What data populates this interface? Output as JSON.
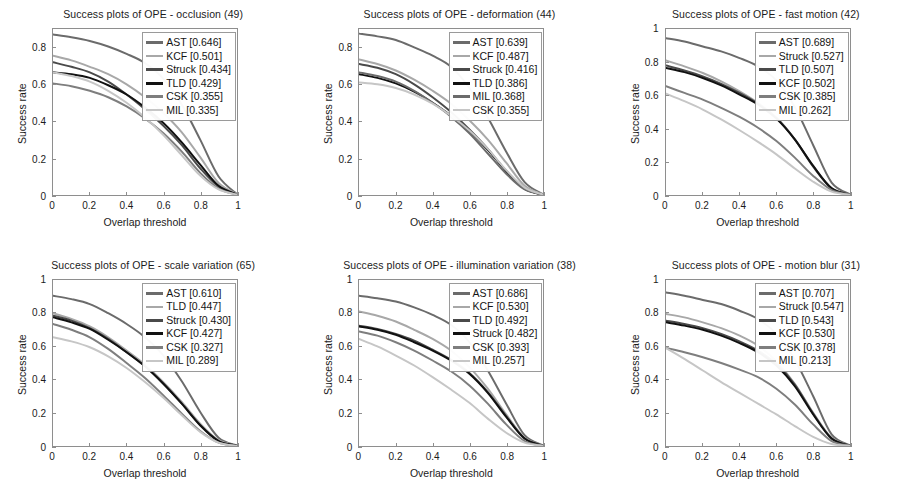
{
  "figure": {
    "axis": {
      "xlabel": "Overlap threshold",
      "ylabel": "Success rate",
      "xticks": [
        "0",
        "0.2",
        "0.4",
        "0.6",
        "0.8",
        "1"
      ],
      "yticks_full": [
        "0",
        "0.2",
        "0.4",
        "0.6",
        "0.8",
        "1"
      ],
      "yticks_clipped": [
        "0",
        "0.2",
        "0.4",
        "0.6",
        "0.8"
      ],
      "grid": false,
      "legend_position": "upper right"
    },
    "colors": {
      "AST": "#6b6b6b",
      "KCF": "#a8a8a8",
      "Struck": "#4a4a4a",
      "TLD": "#111111",
      "CSK": "#7e7e7e",
      "MIL": "#c6c6c6"
    }
  },
  "chart_data": [
    {
      "type": "line",
      "title": "Success plots of OPE - occlusion (49)",
      "xlabel": "Overlap threshold",
      "ylabel": "Success rate",
      "xlim": [
        0,
        1
      ],
      "ylim": [
        0,
        0.9
      ],
      "x": [
        0,
        0.1,
        0.2,
        0.3,
        0.4,
        0.5,
        0.6,
        0.7,
        0.8,
        0.9,
        1
      ],
      "series": [
        {
          "name": "AST",
          "score": "0.646",
          "label": "AST [0.646]",
          "color": "#6b6b6b",
          "values": [
            0.87,
            0.855,
            0.835,
            0.805,
            0.765,
            0.715,
            0.63,
            0.49,
            0.3,
            0.1,
            0.005
          ]
        },
        {
          "name": "KCF",
          "score": "0.501",
          "label": "KCF [0.501]",
          "color": "#a8a8a8",
          "values": [
            0.755,
            0.73,
            0.695,
            0.655,
            0.6,
            0.53,
            0.445,
            0.34,
            0.205,
            0.065,
            0.004
          ]
        },
        {
          "name": "Struck",
          "score": "0.434",
          "label": "Struck [0.434]",
          "color": "#4a4a4a",
          "values": [
            0.72,
            0.695,
            0.665,
            0.615,
            0.545,
            0.465,
            0.375,
            0.27,
            0.145,
            0.045,
            0.003
          ]
        },
        {
          "name": "TLD",
          "score": "0.429",
          "label": "TLD [0.429]",
          "color": "#111111",
          "values": [
            0.665,
            0.655,
            0.635,
            0.595,
            0.545,
            0.475,
            0.39,
            0.285,
            0.165,
            0.05,
            0.003
          ]
        },
        {
          "name": "CSK",
          "score": "0.355",
          "label": "CSK [0.355]",
          "color": "#7e7e7e",
          "values": [
            0.605,
            0.59,
            0.565,
            0.53,
            0.48,
            0.415,
            0.335,
            0.235,
            0.12,
            0.035,
            0.002
          ]
        },
        {
          "name": "MIL",
          "score": "0.335",
          "label": "MIL [0.335]",
          "color": "#c6c6c6",
          "values": [
            0.665,
            0.645,
            0.615,
            0.565,
            0.5,
            0.42,
            0.325,
            0.215,
            0.105,
            0.03,
            0.002
          ]
        }
      ]
    },
    {
      "type": "line",
      "title": "Success plots of OPE - deformation (44)",
      "xlabel": "Overlap threshold",
      "ylabel": "Success rate",
      "xlim": [
        0,
        1
      ],
      "ylim": [
        0,
        0.9
      ],
      "x": [
        0,
        0.1,
        0.2,
        0.3,
        0.4,
        0.5,
        0.6,
        0.7,
        0.8,
        0.9,
        1
      ],
      "series": [
        {
          "name": "AST",
          "score": "0.639",
          "label": "AST [0.639]",
          "color": "#6b6b6b",
          "values": [
            0.875,
            0.86,
            0.84,
            0.8,
            0.755,
            0.695,
            0.58,
            0.42,
            0.235,
            0.07,
            0.004
          ]
        },
        {
          "name": "KCF",
          "score": "0.487",
          "label": "KCF [0.487]",
          "color": "#a8a8a8",
          "values": [
            0.735,
            0.71,
            0.675,
            0.625,
            0.565,
            0.495,
            0.405,
            0.3,
            0.175,
            0.05,
            0.003
          ]
        },
        {
          "name": "Struck",
          "score": "0.416",
          "label": "Struck [0.416]",
          "color": "#4a4a4a",
          "values": [
            0.71,
            0.69,
            0.655,
            0.6,
            0.53,
            0.45,
            0.355,
            0.25,
            0.13,
            0.035,
            0.002
          ]
        },
        {
          "name": "TLD",
          "score": "0.386",
          "label": "TLD [0.386]",
          "color": "#111111",
          "values": [
            0.655,
            0.635,
            0.605,
            0.56,
            0.5,
            0.43,
            0.345,
            0.245,
            0.13,
            0.035,
            0.002
          ]
        },
        {
          "name": "MIL",
          "score": "0.368",
          "label": "MIL [0.368]",
          "color": "#6b6b6b",
          "values": [
            0.665,
            0.645,
            0.615,
            0.565,
            0.5,
            0.425,
            0.335,
            0.225,
            0.115,
            0.03,
            0.002
          ]
        },
        {
          "name": "CSK",
          "score": "0.355",
          "label": "CSK [0.355]",
          "color": "#c6c6c6",
          "values": [
            0.61,
            0.6,
            0.58,
            0.545,
            0.495,
            0.43,
            0.35,
            0.25,
            0.135,
            0.04,
            0.002
          ]
        }
      ]
    },
    {
      "type": "line",
      "title": "Success plots of OPE - fast motion (42)",
      "xlabel": "Overlap threshold",
      "ylabel": "Success rate",
      "xlim": [
        0,
        1
      ],
      "ylim": [
        0,
        1
      ],
      "x": [
        0,
        0.1,
        0.2,
        0.3,
        0.4,
        0.5,
        0.6,
        0.7,
        0.8,
        0.9,
        1
      ],
      "series": [
        {
          "name": "AST",
          "score": "0.689",
          "label": "AST [0.689]",
          "color": "#6b6b6b",
          "values": [
            0.945,
            0.925,
            0.895,
            0.865,
            0.825,
            0.775,
            0.69,
            0.53,
            0.3,
            0.075,
            0.004
          ]
        },
        {
          "name": "Struck",
          "score": "0.527",
          "label": "Struck [0.527]",
          "color": "#a8a8a8",
          "values": [
            0.81,
            0.775,
            0.735,
            0.685,
            0.625,
            0.555,
            0.465,
            0.335,
            0.175,
            0.04,
            0.002
          ]
        },
        {
          "name": "TLD",
          "score": "0.507",
          "label": "TLD [0.507]",
          "color": "#4a4a4a",
          "values": [
            0.78,
            0.75,
            0.715,
            0.67,
            0.615,
            0.55,
            0.465,
            0.335,
            0.17,
            0.04,
            0.002
          ]
        },
        {
          "name": "KCF",
          "score": "0.502",
          "label": "KCF [0.502]",
          "color": "#111111",
          "values": [
            0.765,
            0.74,
            0.705,
            0.66,
            0.605,
            0.545,
            0.46,
            0.335,
            0.175,
            0.04,
            0.002
          ]
        },
        {
          "name": "CSK",
          "score": "0.385",
          "label": "CSK [0.385]",
          "color": "#7e7e7e",
          "values": [
            0.655,
            0.615,
            0.575,
            0.525,
            0.47,
            0.405,
            0.325,
            0.225,
            0.115,
            0.03,
            0.002
          ]
        },
        {
          "name": "MIL",
          "score": "0.262",
          "label": "MIL [0.262]",
          "color": "#c6c6c6",
          "values": [
            0.61,
            0.565,
            0.515,
            0.455,
            0.39,
            0.32,
            0.245,
            0.16,
            0.08,
            0.02,
            0.001
          ]
        }
      ]
    },
    {
      "type": "line",
      "title": "Success plots of OPE - scale variation (65)",
      "xlabel": "Overlap threshold",
      "ylabel": "Success rate",
      "xlim": [
        0,
        1
      ],
      "ylim": [
        0,
        1
      ],
      "x": [
        0,
        0.1,
        0.2,
        0.3,
        0.4,
        0.5,
        0.6,
        0.7,
        0.8,
        0.9,
        1
      ],
      "series": [
        {
          "name": "AST",
          "score": "0.610",
          "label": "AST [0.610]",
          "color": "#6b6b6b",
          "values": [
            0.905,
            0.885,
            0.855,
            0.8,
            0.735,
            0.655,
            0.545,
            0.39,
            0.205,
            0.05,
            0.003
          ]
        },
        {
          "name": "TLD",
          "score": "0.447",
          "label": "TLD [0.447]",
          "color": "#a8a8a8",
          "values": [
            0.8,
            0.765,
            0.72,
            0.655,
            0.575,
            0.49,
            0.385,
            0.265,
            0.135,
            0.035,
            0.002
          ]
        },
        {
          "name": "Struck",
          "score": "0.430",
          "label": "Struck [0.430]",
          "color": "#4a4a4a",
          "values": [
            0.785,
            0.755,
            0.71,
            0.645,
            0.565,
            0.48,
            0.375,
            0.255,
            0.125,
            0.03,
            0.002
          ]
        },
        {
          "name": "KCF",
          "score": "0.427",
          "label": "KCF [0.427]",
          "color": "#111111",
          "values": [
            0.775,
            0.745,
            0.705,
            0.64,
            0.565,
            0.48,
            0.375,
            0.255,
            0.125,
            0.03,
            0.002
          ]
        },
        {
          "name": "CSK",
          "score": "0.327",
          "label": "CSK [0.327]",
          "color": "#7e7e7e",
          "values": [
            0.735,
            0.7,
            0.655,
            0.585,
            0.5,
            0.41,
            0.305,
            0.195,
            0.09,
            0.02,
            0.001
          ]
        },
        {
          "name": "MIL",
          "score": "0.289",
          "label": "MIL [0.289]",
          "color": "#c6c6c6",
          "values": [
            0.655,
            0.63,
            0.595,
            0.54,
            0.47,
            0.385,
            0.29,
            0.185,
            0.085,
            0.02,
            0.001
          ]
        }
      ]
    },
    {
      "type": "line",
      "title": "Success plots of OPE - illumination variation (38)",
      "xlabel": "Overlap threshold",
      "ylabel": "Success rate",
      "xlim": [
        0,
        1
      ],
      "ylim": [
        0,
        1
      ],
      "x": [
        0,
        0.1,
        0.2,
        0.3,
        0.4,
        0.5,
        0.6,
        0.7,
        0.8,
        0.9,
        1
      ],
      "series": [
        {
          "name": "AST",
          "score": "0.686",
          "label": "AST [0.686]",
          "color": "#6b6b6b",
          "values": [
            0.905,
            0.89,
            0.87,
            0.835,
            0.79,
            0.73,
            0.625,
            0.455,
            0.255,
            0.065,
            0.004
          ]
        },
        {
          "name": "KCF",
          "score": "0.530",
          "label": "KCF [0.530]",
          "color": "#a8a8a8",
          "values": [
            0.81,
            0.785,
            0.75,
            0.7,
            0.645,
            0.575,
            0.475,
            0.345,
            0.19,
            0.05,
            0.003
          ]
        },
        {
          "name": "TLD",
          "score": "0.492",
          "label": "TLD [0.492]",
          "color": "#4a4a4a",
          "values": [
            0.725,
            0.705,
            0.675,
            0.635,
            0.58,
            0.52,
            0.44,
            0.325,
            0.18,
            0.045,
            0.002
          ]
        },
        {
          "name": "Struck",
          "score": "0.482",
          "label": "Struck [0.482]",
          "color": "#111111",
          "values": [
            0.72,
            0.7,
            0.67,
            0.625,
            0.575,
            0.515,
            0.435,
            0.32,
            0.175,
            0.045,
            0.002
          ]
        },
        {
          "name": "CSK",
          "score": "0.393",
          "label": "CSK [0.393]",
          "color": "#7e7e7e",
          "values": [
            0.69,
            0.665,
            0.625,
            0.575,
            0.515,
            0.45,
            0.365,
            0.255,
            0.13,
            0.03,
            0.002
          ]
        },
        {
          "name": "MIL",
          "score": "0.257",
          "label": "MIL [0.257]",
          "color": "#c6c6c6",
          "values": [
            0.645,
            0.6,
            0.545,
            0.485,
            0.415,
            0.34,
            0.26,
            0.165,
            0.08,
            0.02,
            0.001
          ]
        }
      ]
    },
    {
      "type": "line",
      "title": "Success plots of OPE - motion blur (31)",
      "xlabel": "Overlap threshold",
      "ylabel": "Success rate",
      "xlim": [
        0,
        1
      ],
      "ylim": [
        0,
        1
      ],
      "x": [
        0,
        0.1,
        0.2,
        0.3,
        0.4,
        0.5,
        0.6,
        0.7,
        0.8,
        0.9,
        1
      ],
      "series": [
        {
          "name": "AST",
          "score": "0.707",
          "label": "AST [0.707]",
          "color": "#6b6b6b",
          "values": [
            0.925,
            0.905,
            0.88,
            0.855,
            0.815,
            0.765,
            0.675,
            0.52,
            0.3,
            0.07,
            0.004
          ]
        },
        {
          "name": "Struck",
          "score": "0.547",
          "label": "Struck [0.547]",
          "color": "#a8a8a8",
          "values": [
            0.795,
            0.775,
            0.745,
            0.71,
            0.665,
            0.605,
            0.51,
            0.375,
            0.2,
            0.05,
            0.002
          ]
        },
        {
          "name": "TLD",
          "score": "0.543",
          "label": "TLD [0.543]",
          "color": "#4a4a4a",
          "values": [
            0.755,
            0.735,
            0.71,
            0.675,
            0.63,
            0.575,
            0.495,
            0.37,
            0.195,
            0.045,
            0.002
          ]
        },
        {
          "name": "KCF",
          "score": "0.530",
          "label": "KCF [0.530]",
          "color": "#111111",
          "values": [
            0.745,
            0.725,
            0.7,
            0.665,
            0.62,
            0.565,
            0.485,
            0.36,
            0.19,
            0.045,
            0.002
          ]
        },
        {
          "name": "CSK",
          "score": "0.378",
          "label": "CSK [0.378]",
          "color": "#7e7e7e",
          "values": [
            0.59,
            0.565,
            0.535,
            0.5,
            0.46,
            0.415,
            0.345,
            0.25,
            0.13,
            0.03,
            0.002
          ]
        },
        {
          "name": "MIL",
          "score": "0.213",
          "label": "MIL [0.213]",
          "color": "#c6c6c6",
          "values": [
            0.59,
            0.525,
            0.455,
            0.385,
            0.32,
            0.255,
            0.19,
            0.12,
            0.055,
            0.012,
            0.001
          ]
        }
      ]
    }
  ]
}
